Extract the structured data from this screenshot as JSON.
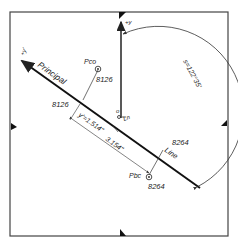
{
  "diagram": {
    "frame": {
      "x": 10,
      "y": 12,
      "width": 218,
      "height": 224
    },
    "colors": {
      "ink": "#222222",
      "paper": "#ffffff",
      "thin": "#444444"
    },
    "axes": {
      "y_axis_label": "+y",
      "y_prime_label": "+y'"
    },
    "principal_line": {
      "label_start": "Principal",
      "label_end": "Line",
      "origin_label": "o",
      "origin_suffix": "Ln"
    },
    "points": [
      {
        "id": "pco",
        "name": "Pco",
        "value": "8126",
        "foot_value": "8126"
      },
      {
        "id": "pbc",
        "name": "Pbc",
        "value": "8264",
        "foot_value": "8264"
      }
    ],
    "dimensions": {
      "y_prime_offset": "y'=1.514\"",
      "span": "3.154\"",
      "angle": "s=122°35'"
    },
    "fiducials": [
      "top",
      "left",
      "right",
      "bottom"
    ]
  }
}
